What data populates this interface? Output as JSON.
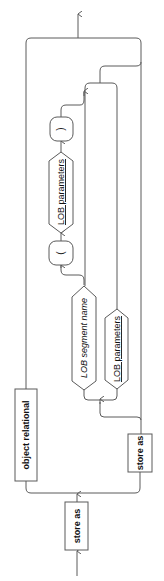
{
  "diagram": {
    "type": "railroad-syntax-diagram",
    "orientation": "rotated-90-ccw",
    "nodes": {
      "store_as_main": {
        "label": "store as",
        "style": "bold",
        "shape": "rect"
      },
      "object_relational": {
        "label": "object relational",
        "style": "bold",
        "shape": "rect"
      },
      "store_as_branch": {
        "label": "store as",
        "style": "bold",
        "shape": "rect"
      },
      "lob_segment_name": {
        "label": "LOB segment name",
        "style": "italic",
        "shape": "pill"
      },
      "lob_parameters_alt": {
        "label": "LOB parameters",
        "style": "underline",
        "shape": "pill"
      },
      "open_paren": {
        "label": "(",
        "shape": "rounded-rect"
      },
      "lob_parameters_inner": {
        "label": "LOB parameters",
        "style": "underline",
        "shape": "pill"
      },
      "close_paren": {
        "label": ")",
        "shape": "rounded-rect"
      }
    },
    "colors": {
      "stroke": "#5a5a5a",
      "text": "#111111",
      "background": "#ffffff"
    }
  }
}
